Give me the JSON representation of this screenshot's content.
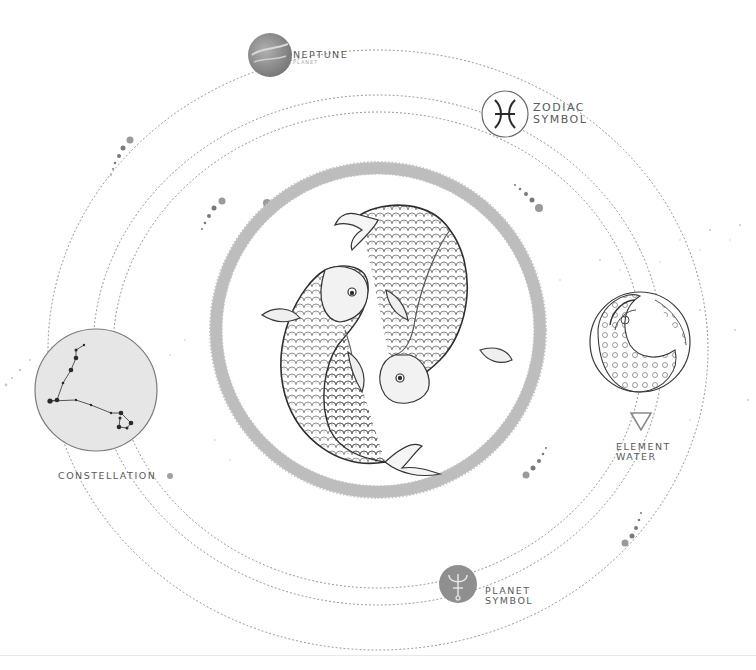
{
  "colors": {
    "background": "#ffffff",
    "orbit_dots": "#8a8a8a",
    "ring": "#bdbdbd",
    "constellation_fill": "#e6e6e6",
    "planet_fill": "#8f8f8f",
    "label_text": "#5a5a5a"
  },
  "labels": {
    "neptune": {
      "title": "NEPTUNE",
      "subtitle": "PLANET"
    },
    "zodiac": {
      "line1": "ZODIAC",
      "line2": "SYMBOL",
      "glyph": "♓"
    },
    "constellation": {
      "title": "CONSTELLATION"
    },
    "element": {
      "line1": "ELEMENT",
      "line2": "WATER",
      "glyph": "▽"
    },
    "planet_symbol": {
      "line1": "PLANET",
      "line2": "SYMBOL",
      "glyph": "♆"
    }
  },
  "illustration": {
    "subject": "Pisces — two koi fish circling",
    "icons": [
      "neptune-planet-icon",
      "pisces-zodiac-icon",
      "pisces-constellation-icon",
      "water-element-icon",
      "neptune-symbol-icon",
      "wave-sphere-icon"
    ]
  }
}
